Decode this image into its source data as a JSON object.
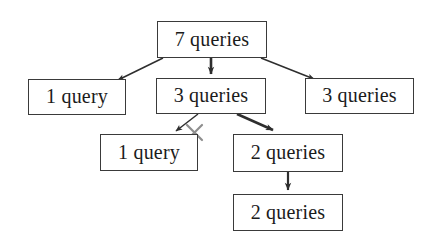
{
  "diagram": {
    "background_color": "#ffffff",
    "box_border_color": "#3a3a3a",
    "text_color": "#1b1b1b",
    "edge_color": "#2e2e2e",
    "x_mark_color": "#8e8e8e",
    "nodes": [
      {
        "id": "root",
        "label": "7 queries",
        "x": 157,
        "y": 21,
        "w": 110,
        "h": 37
      },
      {
        "id": "left1",
        "label": "1 query",
        "x": 28,
        "y": 79,
        "w": 98,
        "h": 36
      },
      {
        "id": "mid3",
        "label": "3 queries",
        "x": 156,
        "y": 78,
        "w": 110,
        "h": 36
      },
      {
        "id": "right3",
        "label": "3 queries",
        "x": 305,
        "y": 78,
        "w": 109,
        "h": 36
      },
      {
        "id": "leaf1",
        "label": "1 query",
        "x": 100,
        "y": 134,
        "w": 98,
        "h": 37
      },
      {
        "id": "two_a",
        "label": "2 queries",
        "x": 233,
        "y": 134,
        "w": 110,
        "h": 38
      },
      {
        "id": "two_b",
        "label": "2 queries",
        "x": 233,
        "y": 194,
        "w": 110,
        "h": 37
      }
    ],
    "edges": [
      {
        "from": "root",
        "to": "left1",
        "kind": "diagonal"
      },
      {
        "from": "root",
        "to": "mid3",
        "kind": "vertical"
      },
      {
        "from": "root",
        "to": "right3",
        "kind": "diagonal"
      },
      {
        "from": "mid3",
        "to": "leaf1",
        "kind": "diagonal"
      },
      {
        "from": "mid3",
        "to": "two_a",
        "kind": "diagonal"
      },
      {
        "from": "two_a",
        "to": "two_b",
        "kind": "vertical"
      }
    ],
    "annotations": [
      {
        "id": "cross",
        "symbol": "X",
        "meaning": "pruned-branch-marker",
        "x": 194,
        "y": 132
      }
    ]
  }
}
